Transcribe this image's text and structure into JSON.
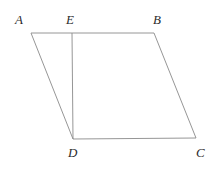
{
  "figure": {
    "type": "parallelogram-with-cevian",
    "stroke_color": "#8a8a8a",
    "label_color": "#2b2b2b",
    "background_color": "#ffffff",
    "stroke_width": 0.9,
    "points": {
      "A": {
        "label": "A",
        "x": 31,
        "y": 33
      },
      "E": {
        "label": "E",
        "x": 72,
        "y": 33
      },
      "B": {
        "label": "B",
        "x": 154,
        "y": 33
      },
      "C": {
        "label": "C",
        "x": 196,
        "y": 138
      },
      "D": {
        "label": "D",
        "x": 73,
        "y": 139
      }
    },
    "segments": [
      {
        "name": "AB",
        "from": "A",
        "to": "B"
      },
      {
        "name": "BC",
        "from": "B",
        "to": "C"
      },
      {
        "name": "CD",
        "from": "C",
        "to": "D"
      },
      {
        "name": "DA",
        "from": "D",
        "to": "A"
      },
      {
        "name": "ED",
        "from": "E",
        "to": "D"
      }
    ],
    "outline_path": "M 31 33 L 154 33 L 196 138 L 73 139 Z",
    "cevian_path": "M 72 33 L 73 139"
  }
}
